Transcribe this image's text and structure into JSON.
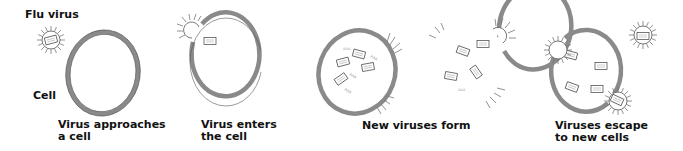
{
  "diagram": {
    "labels": {
      "flu_virus": "Flu virus",
      "cell": "Cell"
    },
    "stages": [
      {
        "line1": "Virus approaches",
        "line2": "a cell"
      },
      {
        "line1": "Virus enters",
        "line2": "the cell"
      },
      {
        "line1": "New viruses form",
        "line2": ""
      },
      {
        "line1": "Viruses escape",
        "line2": "to new cells"
      }
    ],
    "colors": {
      "membrane": "#8a8a8a",
      "text": "#111111",
      "background": "#ffffff"
    }
  }
}
